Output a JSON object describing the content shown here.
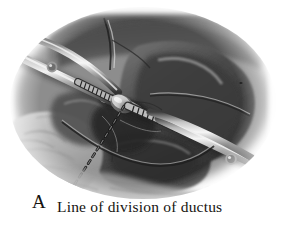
{
  "figure": {
    "kind": "surgical-illustration",
    "panel_letter": "A",
    "caption": "Line of division of ductus",
    "background_color": "#ffffff",
    "ink_color": "#16130f",
    "tones": {
      "deep_shadow": "#272727",
      "dark_tissue": "#3d3d3d",
      "mid_tissue": "#6b6b6b",
      "light_tissue": "#9e9e9e",
      "pale_tissue": "#c9c9c9",
      "highlight": "#efefef",
      "instrument_steel": "#8e8e8e",
      "instrument_highlight": "#f2f2f2",
      "instrument_shadow": "#2e2e2e"
    },
    "annotations": [
      {
        "name": "division-line",
        "style": "dashed",
        "label": "Line of division of ductus",
        "from": [
          124,
          106
        ],
        "to": [
          68,
          198
        ]
      }
    ],
    "instruments": [
      {
        "name": "upper-left-clamp",
        "type": "hemostatic-clamp",
        "orientation": "from upper-left toward center",
        "features": [
          "shank",
          "box-lock rivet",
          "serrated jaw",
          "tapered tip"
        ]
      },
      {
        "name": "lower-right-clamp",
        "type": "hemostatic-clamp",
        "orientation": "from center toward lower-right",
        "features": [
          "serrated jaw",
          "shank",
          "box-lock rivet"
        ]
      }
    ]
  }
}
